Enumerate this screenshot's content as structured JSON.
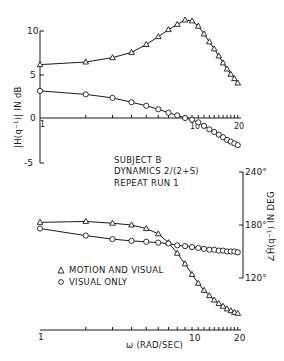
{
  "chart_data": [
    {
      "type": "line",
      "title": "",
      "xlabel": "",
      "ylabel": "|H(q⁻¹)| IN dB",
      "xscale": "log",
      "xlim": [
        1,
        20
      ],
      "ylim": [
        -5,
        11
      ],
      "yticks": [
        "10",
        "5",
        "0",
        "-5"
      ],
      "xticks": [
        "1",
        "10",
        "20"
      ],
      "grid": false,
      "series": [
        {
          "name": "MOTION AND VISUAL",
          "marker": "triangle",
          "x": [
            1,
            2,
            3,
            4,
            5,
            6,
            7,
            8,
            9,
            10,
            11,
            12,
            13,
            14,
            15,
            16,
            17,
            18,
            19,
            20
          ],
          "values": [
            6.1,
            6.4,
            6.9,
            7.5,
            8.4,
            9.3,
            10.1,
            10.7,
            11.2,
            11.1,
            10.5,
            9.6,
            8.7,
            7.9,
            7.1,
            6.3,
            5.6,
            5.0,
            4.5,
            4.0
          ]
        },
        {
          "name": "VISUAL ONLY",
          "marker": "circle",
          "x": [
            1,
            2,
            3,
            4,
            5,
            6,
            7,
            8,
            9,
            10,
            11,
            12,
            13,
            14,
            15,
            16,
            17,
            18,
            19,
            20
          ],
          "values": [
            3.1,
            2.7,
            2.3,
            1.8,
            1.4,
            1.0,
            0.6,
            0.3,
            0.0,
            -0.2,
            -0.5,
            -0.9,
            -1.3,
            -1.6,
            -1.9,
            -2.2,
            -2.5,
            -2.7,
            -2.9,
            -3.1
          ]
        }
      ]
    },
    {
      "type": "line",
      "title": "",
      "xlabel": "ω (RAD/SEC)",
      "ylabel": "∠Ĥ(q⁻¹) IN DEG",
      "xscale": "log",
      "xlim": [
        1,
        20
      ],
      "ylim": [
        75,
        240
      ],
      "yticks": [
        "240°",
        "180°",
        "120°"
      ],
      "xticks": [
        "1",
        "10",
        "20"
      ],
      "grid": false,
      "series": [
        {
          "name": "MOTION AND VISUAL",
          "marker": "triangle",
          "x": [
            1,
            2,
            3,
            4,
            5,
            6,
            7,
            8,
            9,
            10,
            11,
            12,
            13,
            14,
            15,
            16,
            17,
            18,
            19,
            20
          ],
          "values": [
            183,
            184,
            182,
            180,
            176,
            170,
            160,
            148,
            136,
            124,
            114,
            106,
            100,
            95,
            91,
            88,
            85,
            83,
            81,
            80
          ]
        },
        {
          "name": "VISUAL ONLY",
          "marker": "circle",
          "x": [
            1,
            2,
            3,
            4,
            5,
            6,
            7,
            8,
            9,
            10,
            11,
            12,
            13,
            14,
            15,
            16,
            17,
            18,
            19,
            20
          ],
          "values": [
            176,
            168,
            164,
            162,
            161,
            160,
            159,
            157,
            156,
            155,
            154,
            153,
            152,
            152,
            151,
            151,
            150,
            150,
            150,
            149
          ]
        }
      ]
    }
  ],
  "annotations": {
    "subject": "SUBJECT  B",
    "dynamics": "DYNAMICS  2/(2+S)",
    "run": "REPEAT  RUN 1"
  },
  "legend": {
    "motion_visual": "MOTION AND VISUAL",
    "visual_only": "VISUAL  ONLY"
  },
  "axes": {
    "top_ylabel": "|H(q⁻¹)|  IN  dB",
    "top_yticks": [
      "10",
      "5",
      "0",
      "-5"
    ],
    "top_xticks": [
      "1",
      "10",
      "20"
    ],
    "bottom_ylabel": "∠Ĥ(q⁻¹)  IN  DEG",
    "bottom_yticks": [
      "240°",
      "180°",
      "120°"
    ],
    "bottom_xticks": [
      "1",
      "10",
      "20"
    ],
    "xlabel": "ω (RAD/SEC)"
  }
}
